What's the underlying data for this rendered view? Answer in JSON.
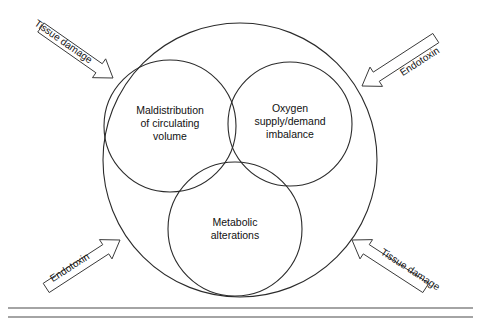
{
  "figure": {
    "type": "venn-diagram",
    "background_color": "#ffffff",
    "stroke_color": "#2b2b2b",
    "outer_circle": {
      "name": "outer-boundary-circle",
      "cx": 240,
      "cy": 160,
      "r": 137
    },
    "inner_circles": [
      {
        "id": "maldistribution",
        "label_lines": [
          "Maldistribution",
          "of circulating",
          "volume"
        ],
        "cx": 170,
        "cy": 126,
        "r": 66,
        "label_x": 170,
        "label_y": 114
      },
      {
        "id": "oxygen",
        "label_lines": [
          "Oxygen",
          "supply/demand",
          "imbalance"
        ],
        "cx": 290,
        "cy": 124,
        "r": 62,
        "label_x": 290,
        "label_y": 112
      },
      {
        "id": "metabolic",
        "label_lines": [
          "Metabolic",
          "alterations"
        ],
        "cx": 235,
        "cy": 229,
        "r": 67,
        "label_x": 235,
        "label_y": 226
      }
    ],
    "arrows": [
      {
        "id": "arrow-top-left",
        "label": "Tissue damage",
        "direction": "down-right",
        "angle_deg": 35,
        "label_x": 63,
        "label_y": 42,
        "tip_x": 113,
        "tip_y": 78
      },
      {
        "id": "arrow-top-right",
        "label": "Endotoxin",
        "direction": "down-left",
        "angle_deg": -33,
        "label_x": 420,
        "label_y": 62,
        "tip_x": 362,
        "tip_y": 86
      },
      {
        "id": "arrow-bottom-left",
        "label": "Endotoxin",
        "direction": "up-right",
        "angle_deg": -33,
        "label_x": 70,
        "label_y": 268,
        "tip_x": 120,
        "tip_y": 240
      },
      {
        "id": "arrow-bottom-right",
        "label": "Tissue damage",
        "direction": "up-left",
        "angle_deg": 33,
        "label_x": 410,
        "label_y": 270,
        "tip_x": 352,
        "tip_y": 240
      }
    ],
    "bottom_rules": [
      {
        "id": "rule-upper",
        "y": 308
      },
      {
        "id": "rule-lower",
        "y": 317
      }
    ]
  },
  "chart_data": {
    "type": "diagram",
    "title": "",
    "sets": [
      "Maldistribution of circulating volume",
      "Oxygen supply/demand imbalance",
      "Metabolic alterations"
    ],
    "container": "outer circle enclosing all three overlapping sets",
    "external_inputs": [
      "Tissue damage",
      "Endotoxin",
      "Endotoxin",
      "Tissue damage"
    ],
    "annotations": []
  }
}
